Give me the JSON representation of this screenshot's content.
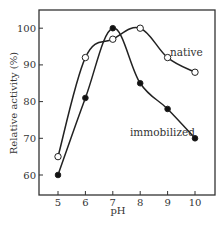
{
  "chart_data": {
    "type": "line",
    "title": "",
    "xlabel": "pH",
    "ylabel": "Relative activity (%)",
    "x": [
      5,
      6,
      7,
      8,
      9,
      10
    ],
    "xticks": [
      "5",
      "6",
      "7",
      "8",
      "9",
      "10"
    ],
    "yticks": [
      "60",
      "70",
      "80",
      "90",
      "100"
    ],
    "xlim": [
      4.3,
      10.7
    ],
    "ylim": [
      55,
      105
    ],
    "grid": false,
    "legend": "inline annotations",
    "series": [
      {
        "name": "native",
        "marker": "open-circle",
        "values": [
          65,
          92,
          97,
          100,
          92,
          88
        ]
      },
      {
        "name": "immobilized",
        "marker": "filled-circle",
        "values": [
          60,
          81,
          100,
          85,
          78,
          70
        ]
      }
    ],
    "annotations": [
      {
        "text": "native",
        "x": 9.2,
        "y": 95
      },
      {
        "text": "immobilized",
        "x": 8.3,
        "y": 73
      }
    ]
  }
}
